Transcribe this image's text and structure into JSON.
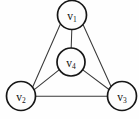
{
  "figure": {
    "background_color": "#fefefe",
    "edge_color": "#3a3a3a",
    "vertex_fill": "#fdfdfd",
    "vertex_stroke": "#161616"
  },
  "chart_data": {
    "type": "diagram",
    "diagram_kind": "undirected-graph",
    "title": "",
    "vertex_count": 4,
    "edge_count": 6,
    "nodes": [
      {
        "id": "v1",
        "label": "v",
        "subscript": "1",
        "cx": 72,
        "cy": 15,
        "r": 14.5
      },
      {
        "id": "v4",
        "label": "v",
        "subscript": "4",
        "cx": 71,
        "cy": 62,
        "r": 14.0
      },
      {
        "id": "v2",
        "label": "v",
        "subscript": "2",
        "cx": 21,
        "cy": 96,
        "r": 14.5
      },
      {
        "id": "v3",
        "label": "v",
        "subscript": "3",
        "cx": 122,
        "cy": 96,
        "r": 14.5
      }
    ],
    "edges": [
      {
        "id": "e-v1-v2",
        "from": "v1",
        "to": "v2",
        "x1": 60.5,
        "y1": 23.8,
        "x2": 32.6,
        "y2": 87.2
      },
      {
        "id": "e-v1-v3",
        "from": "v1",
        "to": "v3",
        "x1": 83.0,
        "y1": 24.5,
        "x2": 111.2,
        "y2": 86.8
      },
      {
        "id": "e-v1-v4",
        "from": "v1",
        "to": "v4",
        "x1": 71.8,
        "y1": 29.5,
        "x2": 71.2,
        "y2": 48.0
      },
      {
        "id": "e-v2-v4",
        "from": "v2",
        "to": "v4",
        "x1": 34.6,
        "y1": 89.4,
        "x2": 59.4,
        "y2": 69.6
      },
      {
        "id": "e-v3-v4",
        "from": "v3",
        "to": "v4",
        "x1": 109.0,
        "y1": 89.5,
        "x2": 82.8,
        "y2": 69.8
      },
      {
        "id": "e-v2-v3",
        "from": "v2",
        "to": "v3",
        "x1": 35.5,
        "y1": 96.2,
        "x2": 107.5,
        "y2": 96.2
      }
    ]
  }
}
